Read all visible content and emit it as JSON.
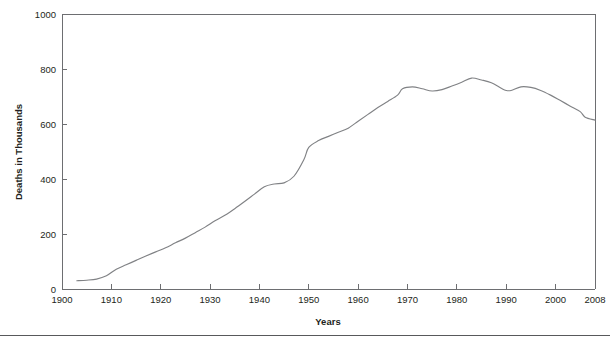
{
  "chart_data": {
    "type": "line",
    "title": "",
    "xlabel": "Years",
    "ylabel": "Deaths in Thousands",
    "xlim": [
      1900,
      2008
    ],
    "ylim": [
      0,
      1000
    ],
    "grid": false,
    "legend": null,
    "line_color": "#808285",
    "axis_color": "#6d6e71",
    "xticks": [
      1900,
      1910,
      1920,
      1930,
      1940,
      1950,
      1960,
      1970,
      1980,
      1990,
      2000,
      2008
    ],
    "xtick_labels": [
      "1900",
      "1910",
      "1920",
      "1930",
      "1940",
      "1950",
      "1960",
      "1970",
      "1980",
      "1990",
      "2000",
      "2008"
    ],
    "yticks": [
      0,
      200,
      400,
      600,
      800,
      1000
    ],
    "ytick_labels": [
      "0",
      "200",
      "400",
      "600",
      "800",
      "1000"
    ],
    "x": [
      1903,
      1905,
      1907,
      1909,
      1911,
      1913,
      1915,
      1917,
      1919,
      1921,
      1923,
      1925,
      1927,
      1929,
      1931,
      1933,
      1935,
      1937,
      1939,
      1941,
      1943,
      1945,
      1947,
      1949,
      1950,
      1952,
      1954,
      1956,
      1958,
      1960,
      1962,
      1964,
      1966,
      1968,
      1969,
      1971,
      1973,
      1975,
      1977,
      1979,
      1981,
      1983,
      1985,
      1987,
      1989,
      1990,
      1991,
      1993,
      1995,
      1997,
      1999,
      2001,
      2003,
      2005,
      2006,
      2008
    ],
    "y": [
      30,
      32,
      36,
      48,
      72,
      88,
      104,
      120,
      135,
      150,
      168,
      185,
      205,
      225,
      248,
      268,
      292,
      318,
      345,
      372,
      382,
      386,
      410,
      470,
      515,
      540,
      555,
      570,
      585,
      610,
      635,
      660,
      682,
      705,
      728,
      735,
      728,
      720,
      725,
      738,
      752,
      767,
      760,
      750,
      730,
      722,
      722,
      735,
      733,
      722,
      705,
      685,
      665,
      645,
      625,
      614
    ],
    "series_name": "Deaths"
  }
}
